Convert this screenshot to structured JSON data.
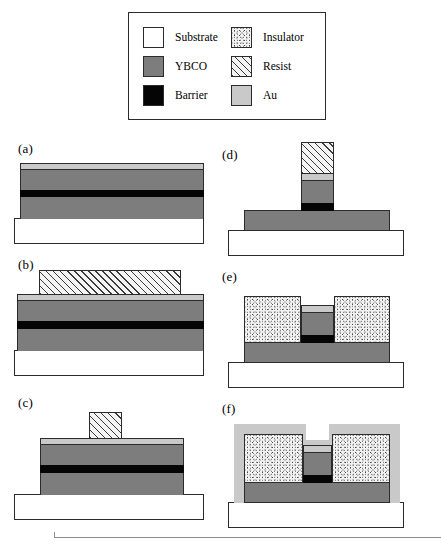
{
  "figure": {
    "type": "process-flow-cross-section",
    "panel_labels": [
      "(a)",
      "(b)",
      "(c)",
      "(d)",
      "(e)",
      "(f)"
    ]
  },
  "legend": {
    "items": [
      {
        "key": "substrate",
        "label": "Substrate",
        "color": "#ffffff",
        "pattern": "solid"
      },
      {
        "key": "ybco",
        "label": "YBCO",
        "color": "#7d7d7d",
        "pattern": "solid"
      },
      {
        "key": "barrier",
        "label": "Barrier",
        "color": "#050505",
        "pattern": "solid"
      },
      {
        "key": "insulator",
        "label": "Insulator",
        "color": "#f2f2f2",
        "pattern": "speckle"
      },
      {
        "key": "resist",
        "label": "Resist",
        "color": "#f4f4f4",
        "pattern": "diagonal-hatch"
      },
      {
        "key": "au",
        "label": "Au",
        "color": "#c9c9c9",
        "pattern": "solid"
      }
    ]
  },
  "panels": {
    "a": {
      "label": "(a)",
      "description": "Blanket trilayer stack on substrate",
      "layers": [
        "substrate",
        "ybco",
        "barrier",
        "ybco",
        "au"
      ]
    },
    "b": {
      "label": "(b)",
      "description": "Resist pattern defined on blanket stack",
      "layers": [
        "substrate",
        "ybco",
        "barrier",
        "ybco",
        "au",
        "resist"
      ]
    },
    "c": {
      "label": "(c)",
      "description": "Narrow resist stripe on partially etched stack",
      "layers": [
        "substrate",
        "ybco",
        "barrier",
        "ybco",
        "au",
        "resist"
      ]
    },
    "d": {
      "label": "(d)",
      "description": "Mesa etched down to base YBCO, resist still present",
      "layers": [
        "substrate",
        "ybco",
        "barrier",
        "ybco",
        "au",
        "resist"
      ]
    },
    "e": {
      "label": "(e)",
      "description": "Insulator deposited either side of mesa, resist removed",
      "layers": [
        "substrate",
        "ybco",
        "barrier",
        "ybco",
        "au",
        "insulator"
      ]
    },
    "f": {
      "label": "(f)",
      "description": "Conformal Au contact layer over insulator and mesa",
      "layers": [
        "substrate",
        "ybco",
        "barrier",
        "ybco",
        "au",
        "insulator",
        "au"
      ]
    }
  }
}
